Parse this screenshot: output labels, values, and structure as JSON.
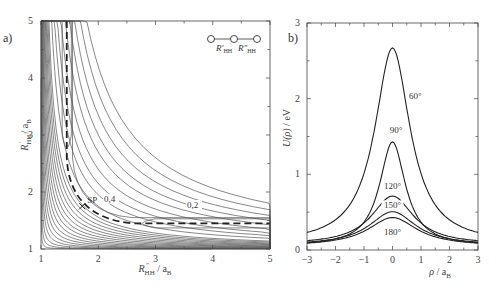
{
  "chart_data": [
    {
      "type": "contour",
      "panel_label": "a)",
      "xlabel": "R''HH / aB",
      "ylabel": "R'HH / aB",
      "xlim": [
        1,
        5
      ],
      "ylim": [
        1,
        5
      ],
      "xticks": [
        "1",
        "2",
        "3",
        "4",
        "5"
      ],
      "yticks": [
        "1",
        "2",
        "3",
        "4",
        "5"
      ],
      "contour_labels": [
        "0,4",
        "0,2"
      ],
      "annotations": [
        "SP"
      ],
      "inset_label": [
        "R'HH",
        "R''HH"
      ],
      "saddle_point": {
        "x": 1.75,
        "y": 1.75
      },
      "reaction_path": "dashed line from (1.45,5) down through SP to (5,1.45)"
    },
    {
      "type": "line",
      "panel_label": "b)",
      "xlabel": "ρ / aB",
      "ylabel": "U(ρ) / eV",
      "xlim": [
        -3,
        3
      ],
      "ylim": [
        0,
        3
      ],
      "xticks": [
        "-3",
        "-2",
        "-1",
        "0",
        "1",
        "2",
        "3"
      ],
      "yticks": [
        "0",
        "1",
        "2",
        "3"
      ],
      "series": [
        {
          "name": "60°",
          "peak": 2.62,
          "tail": 0.1
        },
        {
          "name": "90°",
          "peak": 1.4,
          "tail": 0.07
        },
        {
          "name": "120°",
          "peak": 0.67,
          "tail": 0.09
        },
        {
          "name": "150°",
          "peak": 0.47,
          "tail": 0.08
        },
        {
          "name": "180°",
          "peak": 0.4,
          "tail": 0.07
        }
      ]
    }
  ],
  "left": {
    "panel": "a)",
    "xlabel_main": "R",
    "xlabel_sub": "HH",
    "xlabel_sup": "″",
    "ylabel_main": "R",
    "ylabel_sub": "HH",
    "ylabel_sup": "′",
    "unit": "/ a",
    "unit_sub": "B",
    "sp": "SP",
    "c1": "0,4",
    "c2": "0,2"
  },
  "right": {
    "panel": "b)",
    "labels": [
      "60°",
      "90°",
      "120°",
      "150°",
      "180°"
    ]
  }
}
